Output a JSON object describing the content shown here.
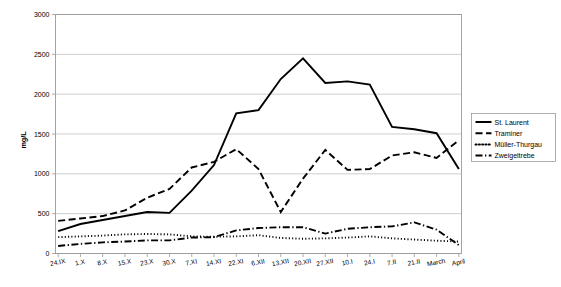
{
  "chart_data": {
    "type": "line",
    "title": "",
    "xlabel": "",
    "ylabel": "mg/L",
    "ylim": [
      0,
      3000
    ],
    "ytick_step": 500,
    "grid": true,
    "legend_position": "right",
    "yticks": [
      "0",
      "500",
      "1000",
      "1500",
      "2000",
      "2500",
      "3000"
    ],
    "categories": [
      "24.IX",
      "1.X",
      "8.X",
      "15.X",
      "23.X",
      "30.X",
      "7.XI",
      "14.XI",
      "22.XI",
      "6.XII",
      "13.XII",
      "20.XII",
      "27.XII",
      "10.I",
      "24.I",
      "7.II",
      "21.II",
      "March",
      "April"
    ],
    "series": [
      {
        "name": "St. Laurent",
        "style": "solid",
        "values": [
          280,
          370,
          420,
          470,
          520,
          510,
          790,
          1110,
          1760,
          1800,
          2190,
          2450,
          2140,
          2160,
          2120,
          1590,
          1560,
          1510,
          1060
        ]
      },
      {
        "name": "Traminer",
        "style": "dashed",
        "values": [
          410,
          440,
          470,
          540,
          700,
          810,
          1080,
          1150,
          1310,
          1060,
          520,
          940,
          1300,
          1050,
          1060,
          1230,
          1270,
          1200,
          1420
        ]
      },
      {
        "name": "Müller-Thurgau",
        "style": "dotted",
        "values": [
          205,
          215,
          225,
          240,
          245,
          240,
          215,
          210,
          215,
          230,
          195,
          185,
          190,
          200,
          215,
          190,
          175,
          160,
          150
        ]
      },
      {
        "name": "Zweigeltrebe",
        "style": "dashdot",
        "values": [
          95,
          120,
          140,
          150,
          165,
          165,
          200,
          205,
          290,
          320,
          330,
          330,
          250,
          310,
          330,
          340,
          390,
          300,
          105
        ]
      }
    ]
  },
  "legend": {
    "items": [
      {
        "label": "St. Laurent",
        "style": "solid"
      },
      {
        "label": "Traminer",
        "style": "dashed"
      },
      {
        "label": "Müller-Thurgau",
        "style": "dotted"
      },
      {
        "label": "Zweigeltrebe",
        "style": "dashdot"
      }
    ]
  }
}
